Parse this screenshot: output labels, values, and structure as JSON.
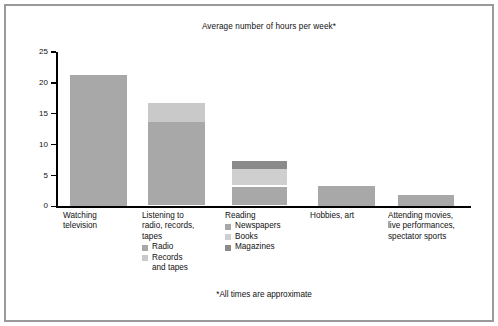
{
  "chart_data": {
    "type": "bar",
    "subtype": "stacked-bar",
    "title": "Average number of hours per week*",
    "footnote": "*All times are approximate",
    "xlabel": "",
    "ylabel": "",
    "ylim": [
      0,
      25
    ],
    "yticks": [
      0,
      5,
      10,
      15,
      20,
      25
    ],
    "ytick_labels": [
      "0",
      "5",
      "10",
      "15",
      "20",
      "25"
    ],
    "grid": false,
    "legend_position": "below-category",
    "categories": [
      "Watching\ntelevision",
      "Listening to\nradio, records,\ntapes",
      "Reading",
      "Hobbies, art",
      "Attending movies,\nlive performances,\nspectator sports"
    ],
    "bars": [
      {
        "category": "Watching\ntelevision",
        "total": 21.3,
        "segments": [
          {
            "name": "Watching television",
            "value": 21.3,
            "color": "#a8a8a8"
          }
        ],
        "legend": []
      },
      {
        "category": "Listening to\nradio, records,\ntapes",
        "total": 16.8,
        "segments": [
          {
            "name": "Radio",
            "value": 13.7,
            "color": "#a8a8a8"
          },
          {
            "name": "Records and tapes",
            "value": 3.1,
            "color": "#c9c9c9"
          }
        ],
        "legend": [
          {
            "label": "Radio",
            "color": "#a8a8a8"
          },
          {
            "label": "Records\nand tapes",
            "color": "#c9c9c9"
          }
        ]
      },
      {
        "category": "Reading",
        "total": 7.3,
        "segments": [
          {
            "name": "Newspapers",
            "value": 3.2,
            "color": "#a8a8a8"
          },
          {
            "name": "Books",
            "value": 2.9,
            "color": "#cfcfcf"
          },
          {
            "name": "Magazines",
            "value": 1.2,
            "color": "#8a8a8a"
          }
        ],
        "legend": [
          {
            "label": "Newspapers",
            "color": "#a8a8a8"
          },
          {
            "label": "Books",
            "color": "#cfcfcf"
          },
          {
            "label": "Magazines",
            "color": "#8a8a8a"
          }
        ]
      },
      {
        "category": "Hobbies, art",
        "total": 3.3,
        "segments": [
          {
            "name": "Hobbies, art",
            "value": 3.3,
            "color": "#a8a8a8"
          }
        ],
        "legend": []
      },
      {
        "category": "Attending movies,\nlive performances,\nspectator sports",
        "total": 1.8,
        "segments": [
          {
            "name": "Attending movies, live performances, spectator sports",
            "value": 1.8,
            "color": "#a8a8a8"
          }
        ],
        "legend": []
      }
    ],
    "colors": {
      "bar_primary": "#a8a8a8",
      "bar_light": "#c9c9c9",
      "bar_lighter": "#cfcfcf",
      "bar_dark": "#8a8a8a",
      "axis": "#000000",
      "frame": "#9a9a9a",
      "background": "#ffffff",
      "text": "#111111"
    }
  },
  "layout": {
    "baseline_y": 206.4,
    "top_y": 52.0,
    "px_per_unit": 6.176,
    "axis_left": 56,
    "bar_slots": [
      {
        "left": 70,
        "width": 57,
        "label_left": 63,
        "label_top": 211,
        "label_width": 72
      },
      {
        "left": 148,
        "width": 57,
        "label_left": 142,
        "label_top": 211,
        "label_width": 76
      },
      {
        "left": 232,
        "width": 55,
        "label_left": 225,
        "label_top": 211,
        "label_width": 84
      },
      {
        "left": 318,
        "width": 57,
        "label_left": 310,
        "label_top": 211,
        "label_width": 76
      },
      {
        "left": 398,
        "width": 56,
        "label_left": 388,
        "label_top": 211,
        "label_width": 86
      }
    ]
  }
}
